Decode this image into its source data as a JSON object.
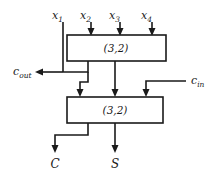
{
  "diagram": {
    "inputs": [
      {
        "name": "x1",
        "base": "x",
        "sub": "1",
        "x": 63,
        "label_x": 56,
        "label_y": 18,
        "arrow": false
      },
      {
        "name": "x2",
        "base": "x",
        "sub": "2",
        "x": 91,
        "label_x": 84,
        "label_y": 18,
        "arrow": true
      },
      {
        "name": "x3",
        "base": "x",
        "sub": "3",
        "x": 120,
        "label_x": 113,
        "label_y": 18,
        "arrow": true
      },
      {
        "name": "x4",
        "base": "x",
        "sub": "4",
        "x": 152,
        "label_x": 145,
        "label_y": 18,
        "arrow": true
      }
    ],
    "carry_in": {
      "base": "c",
      "sub": "in",
      "label_x": 191,
      "label_y": 81
    },
    "carry_out": {
      "base": "c",
      "sub": "out",
      "label_x": 13,
      "label_y": 73
    },
    "boxes": [
      {
        "id": "counter-top",
        "label": "(3,2)",
        "x": 67,
        "y": 35,
        "w": 99,
        "h": 26,
        "label_x": 116,
        "label_y": 52
      },
      {
        "id": "counter-bottom",
        "label": "(3,2)",
        "x": 67,
        "y": 97,
        "w": 96,
        "h": 26,
        "label_x": 115,
        "label_y": 114
      }
    ],
    "outputs": [
      {
        "name": "C",
        "label": "C",
        "label_x": 52,
        "label_y": 165
      },
      {
        "name": "S",
        "label": "S",
        "label_x": 113,
        "label_y": 165
      }
    ],
    "colors": {
      "wire": "#1a1a1a",
      "background": "#ffffff",
      "box_fill": "#ffffff"
    }
  }
}
